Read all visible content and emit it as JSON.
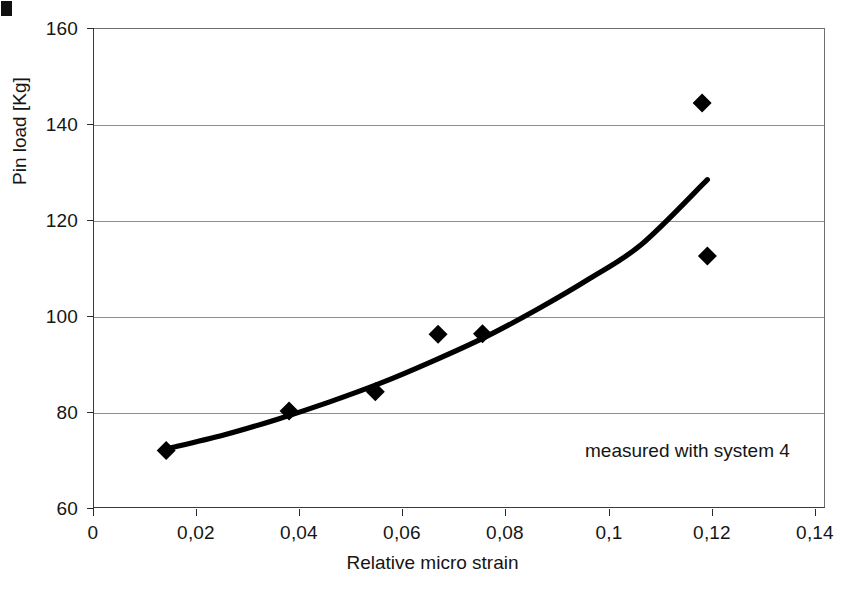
{
  "chart_data": {
    "type": "scatter",
    "title": "",
    "xlabel": "Relative micro strain",
    "ylabel": "Pin load [Kg]",
    "xlim": [
      0,
      0.14
    ],
    "ylim": [
      60,
      160
    ],
    "grid": true,
    "legend": "none",
    "x_tick_labels": [
      "0",
      "0,02",
      "0,04",
      "0,06",
      "0,08",
      "0,1",
      "0,12",
      "0,14"
    ],
    "x_tick_values": [
      0,
      0.02,
      0.04,
      0.06,
      0.08,
      0.1,
      0.12,
      0.14
    ],
    "y_tick_labels": [
      "60",
      "80",
      "100",
      "120",
      "140",
      "160"
    ],
    "y_tick_values": [
      60,
      80,
      100,
      120,
      140,
      160
    ],
    "decimal_separator": "comma",
    "marker": "filled-diamond",
    "marker_color": "#000000",
    "series": [
      {
        "name": "measured data",
        "type": "scatter",
        "x": [
          0.014,
          0.0375,
          0.054,
          0.066,
          0.0745,
          0.1165,
          0.1175
        ],
        "y": [
          72.0,
          80.2,
          84.2,
          96.2,
          96.3,
          144.4,
          112.5
        ]
      },
      {
        "name": "trend curve",
        "type": "line",
        "x": [
          0.014,
          0.025,
          0.035,
          0.045,
          0.055,
          0.065,
          0.075,
          0.085,
          0.095,
          0.105,
          0.1175
        ],
        "y": [
          72.3,
          75.2,
          78.4,
          82.0,
          86.0,
          90.6,
          95.6,
          101.4,
          107.8,
          115.0,
          128.4
        ]
      }
    ],
    "annotations": [
      {
        "text": "measured with system 4",
        "x": 0.0955,
        "y": 68.5
      }
    ]
  },
  "axes": {
    "y_title": "Pin load [Kg]",
    "x_title": "Relative micro strain"
  },
  "marks": {
    "corner_artifact": ""
  }
}
